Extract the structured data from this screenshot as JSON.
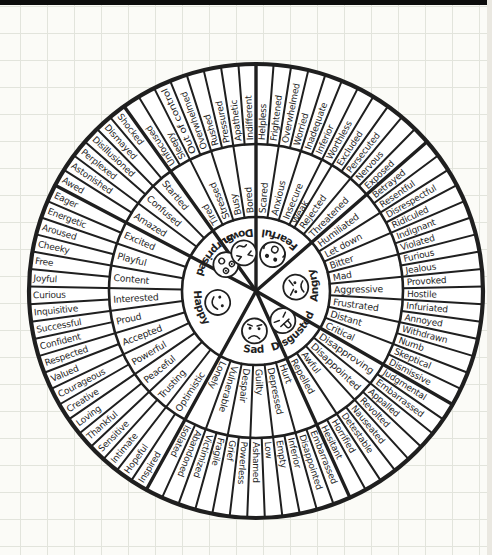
{
  "page": {
    "top_edge_color": "#0d0d0d",
    "paper_color": "#fbfbf7",
    "grid_color": "#e2e4dc",
    "right_edge_color": "#eae8e1"
  },
  "wheel": {
    "name": "feelings-wheel",
    "ink_color": "#1f1f1f",
    "fill_color": "#ffffff",
    "sections": [
      {
        "core": "Fearful",
        "face": "fearful-face",
        "flip": false,
        "middle": [
          {
            "label": "Scared",
            "outer": [
              "Helpless",
              "Frightened"
            ]
          },
          {
            "label": "Anxious",
            "outer": [
              "Overwhelmed",
              "Worried"
            ]
          },
          {
            "label": "Insecure",
            "outer": [
              "Inadequate",
              "Inferior"
            ]
          },
          {
            "label": "Weak",
            "outer": [
              "Worthless"
            ]
          },
          {
            "label": "Rejected",
            "outer": [
              "Excluded",
              "Persecuted"
            ]
          },
          {
            "label": "Threatened",
            "outer": [
              "Nervous",
              "Exposed"
            ]
          }
        ]
      },
      {
        "core": "Angry",
        "face": "angry-face",
        "flip": false,
        "middle": [
          {
            "label": "Humiliated",
            "outer": [
              "Betrayed",
              "Resentful"
            ]
          },
          {
            "label": "Let down",
            "outer": [
              "Disrespectful",
              "Ridiculed"
            ]
          },
          {
            "label": "Bitter",
            "outer": [
              "Indignant",
              "Violated"
            ]
          },
          {
            "label": "Mad",
            "outer": [
              "Furious",
              "Jealous"
            ]
          },
          {
            "label": "Aggressive",
            "outer": [
              "Provoked",
              "Hostile"
            ]
          },
          {
            "label": "Frustrated",
            "outer": [
              "Infuriated",
              "Annoyed"
            ]
          },
          {
            "label": "Distant",
            "outer": [
              "Withdrawn",
              "Numb"
            ]
          },
          {
            "label": "Critical",
            "outer": [
              "Skeptical",
              "Dismissive"
            ]
          }
        ]
      },
      {
        "core": "Disgusted",
        "face": "disgusted-face",
        "flip": false,
        "middle": [
          {
            "label": "Disapproving",
            "outer": [
              "Judgmental",
              "Embarrassed"
            ]
          },
          {
            "label": "Disappointed",
            "outer": [
              "Appalled",
              "Revolted"
            ]
          },
          {
            "label": "Awful",
            "outer": [
              "Nauseated",
              "Detestable"
            ]
          },
          {
            "label": "Repelled",
            "outer": [
              "Horrified",
              "Hesitant"
            ]
          }
        ]
      },
      {
        "core": "Sad",
        "face": "sad-face",
        "flip": false,
        "middle": [
          {
            "label": "Hurt",
            "outer": [
              "Embarrassed",
              "Disappointed"
            ]
          },
          {
            "label": "Depressed",
            "outer": [
              "Inferior",
              "Empty"
            ]
          },
          {
            "label": "Guilty",
            "outer": [
              "Low",
              "Ashamed"
            ]
          },
          {
            "label": "Despair",
            "outer": [
              "Powerless",
              "Grief"
            ]
          },
          {
            "label": "Vulnerable",
            "outer": [
              "Fragile",
              "Victimized"
            ]
          },
          {
            "label": "Lonely",
            "outer": [
              "Abandoned",
              "Isolated"
            ]
          }
        ]
      },
      {
        "core": "Happy",
        "face": "happy-face",
        "flip": true,
        "middle": [
          {
            "label": "Optimistic",
            "outer": [
              "Inspired",
              "Hopeful"
            ]
          },
          {
            "label": "Trusting",
            "outer": [
              "Intimate",
              "Sensitive"
            ]
          },
          {
            "label": "Peaceful",
            "outer": [
              "Thankful",
              "Loving"
            ]
          },
          {
            "label": "Powerful",
            "outer": [
              "Creative",
              "Courageous"
            ]
          },
          {
            "label": "Accepted",
            "outer": [
              "Valued",
              "Respected"
            ]
          },
          {
            "label": "Proud",
            "outer": [
              "Confident",
              "Successful"
            ]
          },
          {
            "label": "Interested",
            "outer": [
              "Inquisitive",
              "Curious"
            ]
          },
          {
            "label": "Content",
            "outer": [
              "Joyful",
              "Free"
            ]
          },
          {
            "label": "Playful",
            "outer": [
              "Cheeky",
              "Aroused"
            ]
          },
          {
            "label": "Excited",
            "outer": [
              "Energetic",
              "Eager"
            ]
          }
        ]
      },
      {
        "core": "Surprised",
        "face": "surprised-face",
        "flip": true,
        "middle": [
          {
            "label": "Amazed",
            "outer": [
              "Awed",
              "Astonished"
            ]
          },
          {
            "label": "Confused",
            "outer": [
              "Perplexed",
              "Disillusioned"
            ]
          },
          {
            "label": "Startled",
            "outer": [
              "Dismayed",
              "Shocked"
            ]
          }
        ]
      },
      {
        "core": "Down",
        "face": "down-face",
        "flip": false,
        "middle": [
          {
            "label": "Tired",
            "outer": [
              "Unfocused",
              "Sleepy"
            ]
          },
          {
            "label": "Stressed",
            "outer": [
              "Out of control",
              "Overwhelmed"
            ]
          },
          {
            "label": "Busy",
            "outer": [
              "Rushed",
              "Pressured"
            ]
          },
          {
            "label": "Bored",
            "outer": [
              "Apathetic",
              "Indifferent"
            ]
          }
        ]
      }
    ]
  }
}
